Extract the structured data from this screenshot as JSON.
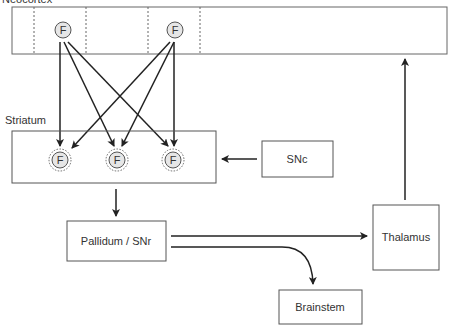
{
  "diagram": {
    "top_region_label": "Neocortex",
    "striatum_label": "Striatum",
    "neuron_symbol": "F",
    "snc_label": "SNc",
    "pallidum_label": "Pallidum / SNr",
    "thalamus_label": "Thalamus",
    "brainstem_label": "Brainstem"
  },
  "colors": {
    "line": "#222222",
    "box_border": "#555555",
    "circle_fill": "#e6e6e6"
  }
}
